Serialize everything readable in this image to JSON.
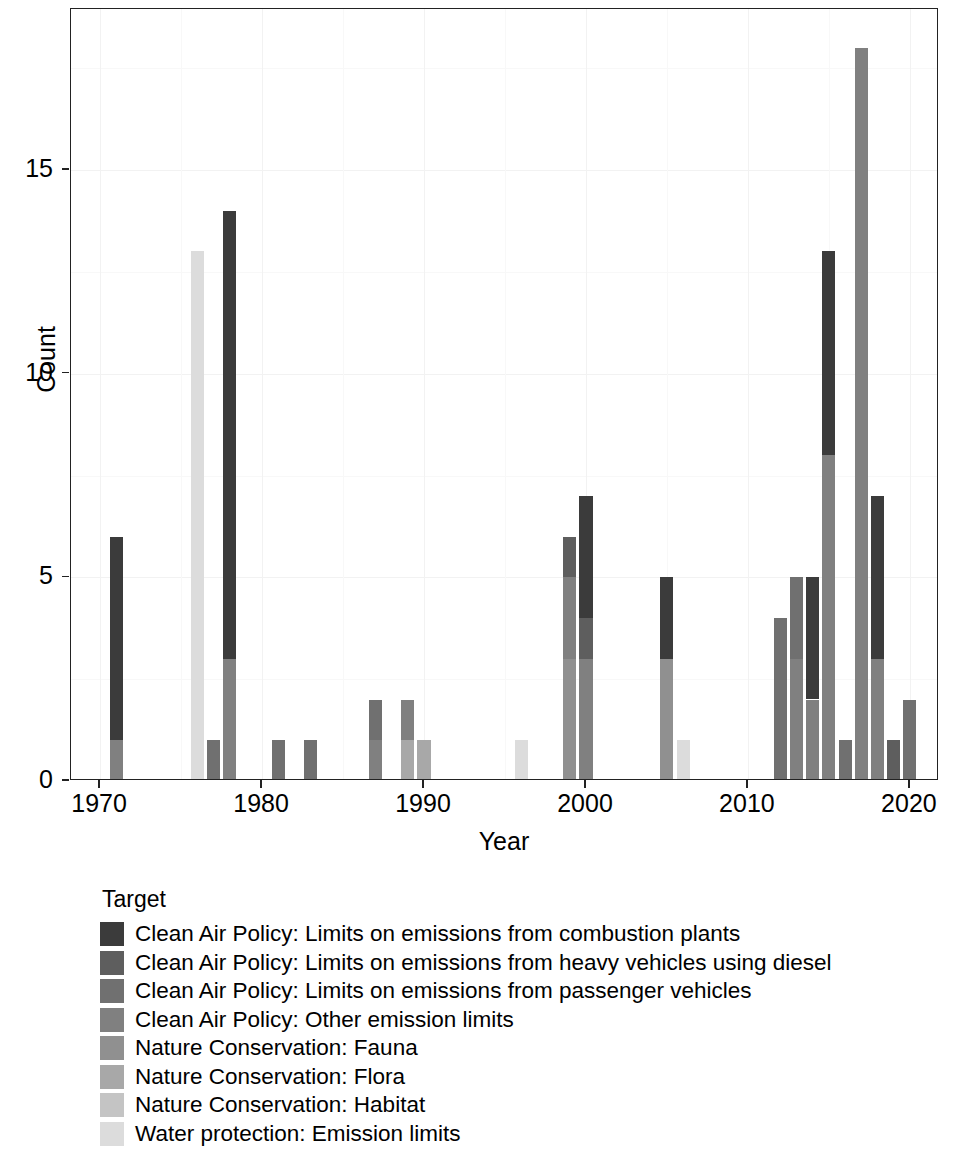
{
  "chart_data": {
    "type": "bar",
    "subtype": "stacked-bar",
    "title": "",
    "xlabel": "Year",
    "ylabel": "Count",
    "xlim": [
      1968.2,
      2021.8
    ],
    "ylim": [
      0,
      18.95
    ],
    "x_ticks": [
      1970,
      1980,
      1990,
      2000,
      2010,
      2020
    ],
    "x_tick_labels": [
      "1970",
      "1980",
      "1990",
      "2000",
      "2010",
      "2020"
    ],
    "y_ticks": [
      0,
      5,
      10,
      15
    ],
    "y_tick_labels": [
      "0",
      "5",
      "10",
      "15"
    ],
    "grid": true,
    "legend_position": "bottom-left",
    "legend_title": "Target",
    "series": [
      {
        "name": "Clean Air Policy: Limits on emissions from combustion plants",
        "color": "#3b3b3b",
        "points": [
          {
            "year": 1971,
            "value": 5
          },
          {
            "year": 1978,
            "value": 11
          },
          {
            "year": 2000,
            "value": 3
          },
          {
            "year": 2005,
            "value": 2
          },
          {
            "year": 2014,
            "value": 3
          },
          {
            "year": 2015,
            "value": 5
          },
          {
            "year": 2018,
            "value": 4
          }
        ]
      },
      {
        "name": "Clean Air Policy: Limits on emissions from heavy vehicles using diesel",
        "color": "#5e5e5e",
        "points": [
          {
            "year": 1999,
            "value": 1
          },
          {
            "year": 2000,
            "value": 1
          },
          {
            "year": 2019,
            "value": 1
          }
        ]
      },
      {
        "name": "Clean Air Policy: Limits on emissions from passenger vehicles",
        "color": "#707070",
        "points": [
          {
            "year": 1977,
            "value": 1
          },
          {
            "year": 1981,
            "value": 1
          },
          {
            "year": 1983,
            "value": 1
          },
          {
            "year": 1987,
            "value": 1
          },
          {
            "year": 2012,
            "value": 4
          },
          {
            "year": 2013,
            "value": 2
          },
          {
            "year": 2016,
            "value": 1
          },
          {
            "year": 2020,
            "value": 2
          }
        ]
      },
      {
        "name": "Clean Air Policy: Other emission limits",
        "color": "#808080",
        "points": [
          {
            "year": 1971,
            "value": 1
          },
          {
            "year": 1978,
            "value": 3
          },
          {
            "year": 1987,
            "value": 1
          },
          {
            "year": 1989,
            "value": 1
          },
          {
            "year": 1999,
            "value": 2
          },
          {
            "year": 2000,
            "value": 3
          },
          {
            "year": 2013,
            "value": 3
          },
          {
            "year": 2014,
            "value": 2
          },
          {
            "year": 2015,
            "value": 8
          },
          {
            "year": 2017,
            "value": 18
          },
          {
            "year": 2018,
            "value": 3
          }
        ]
      },
      {
        "name": "Nature Conservation: Fauna",
        "color": "#909090",
        "points": [
          {
            "year": 1999,
            "value": 3
          },
          {
            "year": 2005,
            "value": 3
          }
        ]
      },
      {
        "name": "Nature Conservation: Flora",
        "color": "#a8a8a8",
        "points": [
          {
            "year": 1989,
            "value": 1
          },
          {
            "year": 1990,
            "value": 1
          }
        ]
      },
      {
        "name": "Nature Conservation: Habitat",
        "color": "#c4c4c4",
        "points": []
      },
      {
        "name": "Water protection: Emission limits",
        "color": "#dcdcdc",
        "points": [
          {
            "year": 1976,
            "value": 13
          },
          {
            "year": 1996,
            "value": 1
          },
          {
            "year": 2006,
            "value": 1
          }
        ]
      }
    ],
    "stacks": [
      {
        "year": 1971,
        "total": 6,
        "segments": [
          {
            "series": 3,
            "value": 1
          },
          {
            "series": 0,
            "value": 5
          }
        ]
      },
      {
        "year": 1976,
        "total": 13,
        "segments": [
          {
            "series": 7,
            "value": 13
          }
        ]
      },
      {
        "year": 1977,
        "total": 1,
        "segments": [
          {
            "series": 2,
            "value": 1
          }
        ]
      },
      {
        "year": 1978,
        "total": 14,
        "segments": [
          {
            "series": 3,
            "value": 3
          },
          {
            "series": 0,
            "value": 11
          }
        ]
      },
      {
        "year": 1981,
        "total": 1,
        "segments": [
          {
            "series": 2,
            "value": 1
          }
        ]
      },
      {
        "year": 1983,
        "total": 1,
        "segments": [
          {
            "series": 2,
            "value": 1
          }
        ]
      },
      {
        "year": 1987,
        "total": 2,
        "segments": [
          {
            "series": 3,
            "value": 1
          },
          {
            "series": 2,
            "value": 1
          }
        ]
      },
      {
        "year": 1989,
        "total": 2,
        "segments": [
          {
            "series": 5,
            "value": 1
          },
          {
            "series": 3,
            "value": 1
          }
        ]
      },
      {
        "year": 1990,
        "total": 1,
        "segments": [
          {
            "series": 5,
            "value": 1
          }
        ]
      },
      {
        "year": 1996,
        "total": 1,
        "segments": [
          {
            "series": 7,
            "value": 1
          }
        ]
      },
      {
        "year": 1999,
        "total": 6,
        "segments": [
          {
            "series": 4,
            "value": 3
          },
          {
            "series": 3,
            "value": 2
          },
          {
            "series": 1,
            "value": 1
          }
        ]
      },
      {
        "year": 2000,
        "total": 7,
        "segments": [
          {
            "series": 3,
            "value": 3
          },
          {
            "series": 1,
            "value": 1
          },
          {
            "series": 0,
            "value": 3
          }
        ]
      },
      {
        "year": 2005,
        "total": 5,
        "segments": [
          {
            "series": 4,
            "value": 3
          },
          {
            "series": 0,
            "value": 2
          }
        ]
      },
      {
        "year": 2006,
        "total": 1,
        "segments": [
          {
            "series": 7,
            "value": 1
          }
        ]
      },
      {
        "year": 2012,
        "total": 4,
        "segments": [
          {
            "series": 2,
            "value": 4
          }
        ]
      },
      {
        "year": 2013,
        "total": 5,
        "segments": [
          {
            "series": 3,
            "value": 3
          },
          {
            "series": 2,
            "value": 2
          }
        ]
      },
      {
        "year": 2014,
        "total": 5,
        "segments": [
          {
            "series": 3,
            "value": 2
          },
          {
            "series": 0,
            "value": 3
          }
        ]
      },
      {
        "year": 2015,
        "total": 13,
        "segments": [
          {
            "series": 3,
            "value": 8
          },
          {
            "series": 0,
            "value": 5
          }
        ]
      },
      {
        "year": 2016,
        "total": 1,
        "segments": [
          {
            "series": 2,
            "value": 1
          }
        ]
      },
      {
        "year": 2017,
        "total": 18,
        "segments": [
          {
            "series": 3,
            "value": 18
          }
        ]
      },
      {
        "year": 2018,
        "total": 7,
        "segments": [
          {
            "series": 3,
            "value": 3
          },
          {
            "series": 0,
            "value": 4
          }
        ]
      },
      {
        "year": 2019,
        "total": 1,
        "segments": [
          {
            "series": 1,
            "value": 1
          }
        ]
      },
      {
        "year": 2020,
        "total": 2,
        "segments": [
          {
            "series": 2,
            "value": 2
          }
        ]
      }
    ]
  },
  "legend": {
    "title": "Target",
    "entries": [
      {
        "label": "Clean Air Policy: Limits on emissions from combustion plants",
        "color": "#3b3b3b"
      },
      {
        "label": "Clean Air Policy: Limits on emissions from heavy vehicles using diesel",
        "color": "#5e5e5e"
      },
      {
        "label": "Clean Air Policy: Limits on emissions from passenger vehicles",
        "color": "#707070"
      },
      {
        "label": "Clean Air Policy: Other emission limits",
        "color": "#808080"
      },
      {
        "label": "Nature Conservation: Fauna",
        "color": "#909090"
      },
      {
        "label": "Nature Conservation: Flora",
        "color": "#a8a8a8"
      },
      {
        "label": "Nature Conservation: Habitat",
        "color": "#c4c4c4"
      },
      {
        "label": "Water protection: Emission limits",
        "color": "#dcdcdc"
      }
    ]
  },
  "axes": {
    "y_title": "Count",
    "x_title": "Year"
  }
}
